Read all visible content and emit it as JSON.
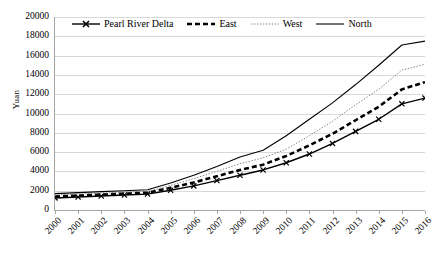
{
  "chart_data": {
    "type": "line",
    "title": "",
    "xlabel": "",
    "ylabel": "Yuan",
    "ylim": [
      0,
      20000
    ],
    "ytick_step": 2000,
    "grid": true,
    "legend_position": "top-center",
    "categories": [
      "2000",
      "2001",
      "2002",
      "2003",
      "2004",
      "2005",
      "2006",
      "2007",
      "2008",
      "2009",
      "2010",
      "2011",
      "2012",
      "2013",
      "2014",
      "2015",
      "2016"
    ],
    "yticks": [
      "0",
      "2000",
      "4000",
      "6000",
      "8000",
      "10000",
      "12000",
      "14000",
      "16000",
      "18000",
      "20000"
    ],
    "series": [
      {
        "name": "Pearl River Delta",
        "style": "solid-marker-x",
        "marker": "x",
        "color": "#000000",
        "values": [
          1250,
          1350,
          1450,
          1550,
          1650,
          2050,
          2500,
          3050,
          3600,
          4150,
          4900,
          5800,
          6900,
          8150,
          9400,
          11000,
          11600
        ]
      },
      {
        "name": "East",
        "style": "thick-dashed",
        "marker": "none",
        "color": "#000000",
        "values": [
          1400,
          1500,
          1600,
          1700,
          1800,
          2300,
          2850,
          3500,
          4150,
          4700,
          5600,
          6700,
          7900,
          9300,
          10700,
          12500,
          13250
        ]
      },
      {
        "name": "West",
        "style": "fine-dotted",
        "marker": "none",
        "color": "#808080",
        "values": [
          1550,
          1650,
          1750,
          1850,
          1950,
          2550,
          3250,
          4000,
          4800,
          5400,
          6300,
          7700,
          9200,
          10900,
          12500,
          14500,
          15100
        ]
      },
      {
        "name": "North",
        "style": "thin-solid",
        "marker": "none",
        "color": "#000000",
        "values": [
          1700,
          1800,
          1900,
          2000,
          2100,
          2800,
          3600,
          4500,
          5500,
          6200,
          7700,
          9400,
          11100,
          13000,
          15000,
          17100,
          17500
        ]
      }
    ]
  },
  "legend": {
    "items": [
      {
        "label": "Pearl River Delta"
      },
      {
        "label": "East"
      },
      {
        "label": "West"
      },
      {
        "label": "North"
      }
    ]
  }
}
